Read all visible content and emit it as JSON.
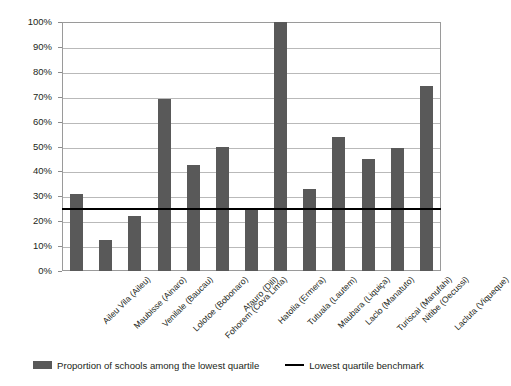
{
  "chart_data": {
    "type": "bar",
    "title": "",
    "subtitle": "",
    "xlabel": "",
    "ylabel": "",
    "ylim": [
      0,
      100
    ],
    "grid": true,
    "legend_position": "bottom",
    "categories": [
      "Aileu Vila (Aileu)",
      "Maubisse (Ainaro)",
      "Venilale (Baucau)",
      "Lolotoe (Bobonaro)",
      "Fohorem (Cova Lima)",
      "Atauro (Dili)",
      "Hatolia (Ermera)",
      "Tutuala (Lautem)",
      "Maubara (Liquiça)",
      "Laclo (Manatuto)",
      "Turiscai (Manufahi)",
      "Nitibe (Oecussi)",
      "Lacluta (Viqueque)"
    ],
    "series": [
      {
        "name": "Proportion of schools among the lowest quartile",
        "color": "#595959",
        "values": [
          31,
          12.5,
          22,
          69,
          42.7,
          49.8,
          25.5,
          100,
          33,
          53.7,
          44.8,
          49.5,
          74.5
        ]
      }
    ],
    "reference_line": {
      "name": "Lowest quartile benchmark",
      "value": 25,
      "color": "#000000"
    },
    "y_ticks": [
      "0%",
      "10%",
      "20%",
      "30%",
      "40%",
      "50%",
      "60%",
      "70%",
      "80%",
      "90%",
      "100%"
    ],
    "y_tick_values": [
      0,
      10,
      20,
      30,
      40,
      50,
      60,
      70,
      80,
      90,
      100
    ]
  },
  "legend": {
    "bar_label": "Proportion of schools among the lowest quartile",
    "line_label": "Lowest quartile benchmark"
  }
}
